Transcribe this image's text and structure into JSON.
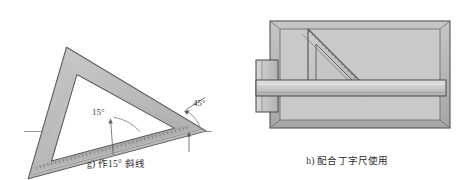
{
  "sheet": {
    "width": 463,
    "height": 180,
    "background": "#ffffff"
  },
  "palette": {
    "paper": "#ffffff",
    "tool_fill": "#c2c2c2",
    "tool_fill_light": "#d2d2d2",
    "tool_fill_dark": "#a8a8a8",
    "board_interior": "#c9c9c9",
    "board_frame": "#b4b4b4",
    "outline": "#4a4a4a",
    "outline_soft": "#7d7d7d",
    "text": "#2b2b2b",
    "baseline": "#8a8a8a"
  },
  "figures": [
    {
      "id": "g",
      "name": "set-square-15-degree-line",
      "caption": "g) 作15° 斜线",
      "caption_label": "g)",
      "caption_text": "作15° 斜线",
      "tool": "30-60-90 set square",
      "annotations": [
        {
          "name": "angle-15",
          "label": "15°",
          "value": 15,
          "unit": "degree"
        },
        {
          "name": "angle-45",
          "label": "45°",
          "value": 45,
          "unit": "degree"
        }
      ],
      "baseline": {
        "name": "horizontal-reference-line",
        "visible": true
      },
      "scale_edge": {
        "name": "graduated-hypotenuse",
        "ticks": true
      }
    },
    {
      "id": "h",
      "name": "set-square-with-tsquare",
      "caption": "h) 配合丁字尺使用",
      "caption_label": "h)",
      "caption_text": "配合丁字尺使用",
      "tool": "45-45-90 set square on T-square",
      "parts": [
        {
          "name": "drawing-board",
          "label": "drawing board"
        },
        {
          "name": "t-square-head",
          "label": "T-square head"
        },
        {
          "name": "t-square-blade",
          "label": "T-square blade"
        },
        {
          "name": "set-square-45",
          "label": "45° set square"
        }
      ],
      "annotations": [],
      "scale_edge": {
        "name": "graduated-hypotenuse",
        "ticks": true
      }
    }
  ]
}
